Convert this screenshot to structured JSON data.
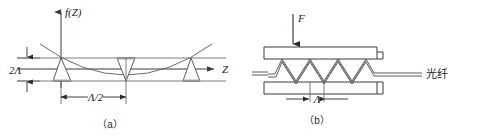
{
  "figure": {
    "panels": [
      {
        "id": "a",
        "caption": "（a）",
        "axis": {
          "y_label": "f(Z)",
          "x_label": "Z"
        },
        "annotations": {
          "amplitude_label": "2Λ",
          "period_label": "Λ/2"
        },
        "curve": "parabolic envelope",
        "tooth_count": 3,
        "tooth_orientations": [
          "up",
          "down",
          "up"
        ],
        "horizontal_line_count": 3
      },
      {
        "id": "b",
        "caption": "（b）",
        "annotations": {
          "force_label": "F",
          "period_label": "Λ",
          "fiber_label": "光纤"
        },
        "zigzag_peaks": 7,
        "plate_count": 2
      }
    ],
    "colors": {
      "ink": "#1a1a1a",
      "line": "#3a3a3a",
      "thin_line": "#6e6e6e",
      "shade": "#9a9a9a",
      "background": "#ffffff"
    }
  }
}
